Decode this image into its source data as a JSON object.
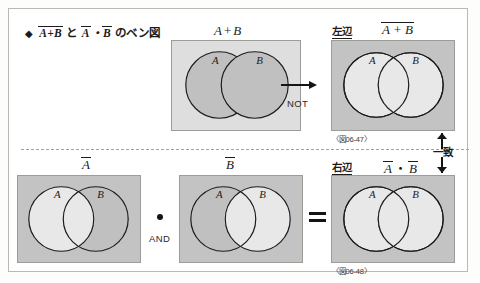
{
  "figure": {
    "title_prefix": "◆",
    "title_term1_over": "A+B",
    "title_connector": "と",
    "title_term2_a": "A",
    "title_term2_op": "・",
    "title_term2_b": "B",
    "title_suffix": "のベン図",
    "colors": {
      "panel_light": "#dedede",
      "panel_dark": "#c3c3c3",
      "circle_light": "#e8e8e8",
      "circle_dark": "#c0c0c0",
      "ink": "#1b1b1b",
      "frame_border": "#b9b9b4",
      "divider": "#9aa4b0"
    }
  },
  "panels": {
    "top_mid": {
      "name": "A + B",
      "caption_a": "A",
      "caption_op": "+",
      "caption_b": "B",
      "circle_a_label": "A",
      "circle_b_label": "B"
    },
    "top_right": {
      "side_label": "左辺",
      "formula_over": "A + B",
      "fig_no": "〈図06-47〉",
      "circle_a_label": "A",
      "circle_b_label": "B"
    },
    "bottom_left": {
      "caption": "A",
      "circle_a_label": "A",
      "circle_b_label": "B"
    },
    "bottom_mid": {
      "caption": "B",
      "circle_a_label": "A",
      "circle_b_label": "B"
    },
    "bottom_right": {
      "side_label": "右辺",
      "formula_a": "A",
      "formula_op": "・",
      "formula_b": "B",
      "fig_no": "〈図06-48〉",
      "circle_a_label": "A",
      "circle_b_label": "B"
    }
  },
  "operators": {
    "not_label": "NOT",
    "and_label": "AND",
    "match_label": "一致"
  }
}
